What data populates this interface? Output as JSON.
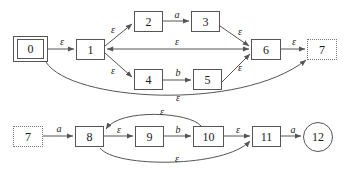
{
  "diagram": {
    "type": "state-machine",
    "stroke_color": "#555555",
    "text_color": "#1a1a1a",
    "background": "#ffffff",
    "nodes": [
      {
        "id": "n0",
        "label": "0",
        "shape": "double-box",
        "x": 13,
        "y": 36,
        "w": 35,
        "h": 26,
        "role": "start"
      },
      {
        "id": "n1",
        "label": "1",
        "shape": "box",
        "x": 76,
        "y": 39,
        "w": 29,
        "h": 21,
        "role": "state"
      },
      {
        "id": "n2",
        "label": "2",
        "shape": "box",
        "x": 134,
        "y": 11,
        "w": 29,
        "h": 21,
        "role": "state"
      },
      {
        "id": "n3",
        "label": "3",
        "shape": "box",
        "x": 191,
        "y": 11,
        "w": 29,
        "h": 21,
        "role": "state"
      },
      {
        "id": "n4",
        "label": "4",
        "shape": "box",
        "x": 134,
        "y": 69,
        "w": 29,
        "h": 21,
        "role": "state"
      },
      {
        "id": "n5",
        "label": "5",
        "shape": "box",
        "x": 193,
        "y": 69,
        "w": 29,
        "h": 21,
        "role": "state"
      },
      {
        "id": "n6",
        "label": "6",
        "shape": "box",
        "x": 251,
        "y": 39,
        "w": 30,
        "h": 21,
        "role": "state"
      },
      {
        "id": "n7t",
        "label": "7",
        "shape": "dotted-box",
        "x": 307,
        "y": 39,
        "w": 30,
        "h": 21,
        "role": "continuation"
      },
      {
        "id": "n7b",
        "label": "7",
        "shape": "dotted-box",
        "x": 13,
        "y": 126,
        "w": 30,
        "h": 21,
        "role": "continuation"
      },
      {
        "id": "n8",
        "label": "8",
        "shape": "box",
        "x": 75,
        "y": 126,
        "w": 29,
        "h": 21,
        "role": "state"
      },
      {
        "id": "n9",
        "label": "9",
        "shape": "box",
        "x": 135,
        "y": 126,
        "w": 29,
        "h": 21,
        "role": "state"
      },
      {
        "id": "n10",
        "label": "10",
        "shape": "box",
        "x": 193,
        "y": 126,
        "w": 31,
        "h": 21,
        "role": "state"
      },
      {
        "id": "n11",
        "label": "11",
        "shape": "box",
        "x": 252,
        "y": 126,
        "w": 29,
        "h": 21,
        "role": "state"
      },
      {
        "id": "n12",
        "label": "12",
        "shape": "circle",
        "x": 303,
        "y": 122,
        "w": 30,
        "h": 30,
        "role": "accept"
      }
    ],
    "edges": [
      {
        "id": "e0",
        "from": "n0",
        "to": "n1",
        "label": "ε",
        "lx": 62,
        "ly": 42
      },
      {
        "id": "e1",
        "from": "n1",
        "to": "n2",
        "label": "ε",
        "lx": 113,
        "ly": 30
      },
      {
        "id": "e2",
        "from": "n2",
        "to": "n3",
        "label": "a",
        "lx": 177,
        "ly": 15
      },
      {
        "id": "e3",
        "from": "n3",
        "to": "n6",
        "label": "ε",
        "lx": 240,
        "ly": 32
      },
      {
        "id": "e4",
        "from": "n1",
        "to": "n4",
        "label": "ε",
        "lx": 113,
        "ly": 71
      },
      {
        "id": "e5",
        "from": "n4",
        "to": "n5",
        "label": "b",
        "lx": 178,
        "ly": 73
      },
      {
        "id": "e6",
        "from": "n5",
        "to": "n6",
        "label": "ε",
        "lx": 240,
        "ly": 68
      },
      {
        "id": "e7",
        "from": "n6",
        "to": "n1",
        "label": "ε",
        "lx": 177,
        "ly": 42,
        "note": "bidirectional horizontal"
      },
      {
        "id": "e8",
        "from": "n6",
        "to": "n7t",
        "label": "ε",
        "lx": 294,
        "ly": 42
      },
      {
        "id": "e9",
        "from": "n0",
        "to": "n7t",
        "label": "ε",
        "lx": 178,
        "ly": 98,
        "note": "long bottom arc"
      },
      {
        "id": "e10",
        "from": "n7b",
        "to": "n8",
        "label": "a",
        "lx": 59,
        "ly": 129
      },
      {
        "id": "e11",
        "from": "n8",
        "to": "n9",
        "label": "ε",
        "lx": 119,
        "ly": 130
      },
      {
        "id": "e12",
        "from": "n9",
        "to": "n10",
        "label": "b",
        "lx": 178,
        "ly": 130
      },
      {
        "id": "e13",
        "from": "n10",
        "to": "n8",
        "label": "ε",
        "lx": 162,
        "ly": 112,
        "note": "upper arc back"
      },
      {
        "id": "e14",
        "from": "n10",
        "to": "n11",
        "label": "ε",
        "lx": 238,
        "ly": 130
      },
      {
        "id": "e15",
        "from": "n8",
        "to": "n11",
        "label": "ε",
        "lx": 177,
        "ly": 159,
        "note": "lower arc forward"
      },
      {
        "id": "e16",
        "from": "n11",
        "to": "n12",
        "label": "a",
        "lx": 293,
        "ly": 130
      }
    ]
  }
}
